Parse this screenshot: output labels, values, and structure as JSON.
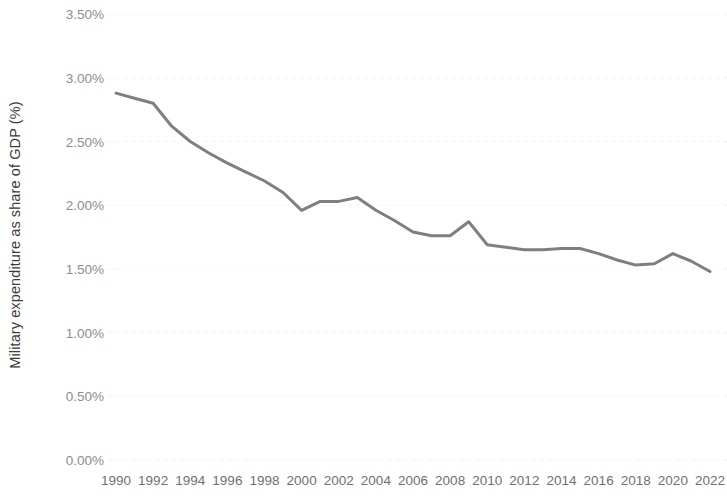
{
  "chart_data": {
    "type": "line",
    "title": "",
    "xlabel": "",
    "ylabel": "Military expenditure as share of GDP (%)",
    "series_color": "#7f7f7f",
    "grid": true,
    "grid_color": "#efefef",
    "legend": "none",
    "xlim": [
      1990,
      2022
    ],
    "ylim": [
      0,
      3.5
    ],
    "y_tick_labels": [
      "3.50%",
      "3.00%",
      "2.50%",
      "2.00%",
      "1.50%",
      "1.00%",
      "0.50%",
      "0.00%"
    ],
    "y_tick_values": [
      3.5,
      3.0,
      2.5,
      2.0,
      1.5,
      1.0,
      0.5,
      0.0
    ],
    "x_tick_labels": [
      "1990",
      "1992",
      "1994",
      "1996",
      "1998",
      "2000",
      "2002",
      "2004",
      "2006",
      "2008",
      "2010",
      "2012",
      "2014",
      "2016",
      "2018",
      "2020",
      "2022"
    ],
    "x_tick_values": [
      1990,
      1992,
      1994,
      1996,
      1998,
      2000,
      2002,
      2004,
      2006,
      2008,
      2010,
      2012,
      2014,
      2016,
      2018,
      2020,
      2022
    ],
    "x": [
      1990,
      1991,
      1992,
      1993,
      1994,
      1995,
      1996,
      1997,
      1998,
      1999,
      2000,
      2001,
      2002,
      2003,
      2004,
      2005,
      2006,
      2007,
      2008,
      2009,
      2010,
      2011,
      2012,
      2013,
      2014,
      2015,
      2016,
      2017,
      2018,
      2019,
      2020,
      2021,
      2022
    ],
    "values": [
      2.88,
      2.84,
      2.8,
      2.62,
      2.5,
      2.41,
      2.33,
      2.26,
      2.19,
      2.1,
      1.96,
      2.03,
      2.03,
      2.06,
      1.96,
      1.88,
      1.79,
      1.76,
      1.76,
      1.87,
      1.69,
      1.67,
      1.65,
      1.65,
      1.66,
      1.66,
      1.62,
      1.57,
      1.53,
      1.54,
      1.62,
      1.56,
      1.48
    ],
    "units": "percent"
  }
}
